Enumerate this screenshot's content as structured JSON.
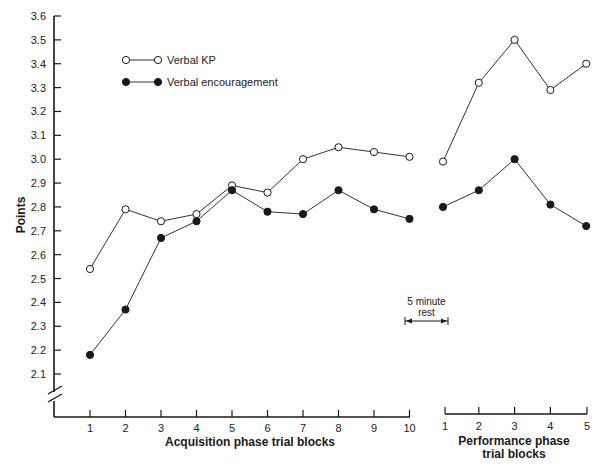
{
  "chart_data": {
    "type": "line",
    "title": "",
    "ylabel": "Points",
    "ylim": [
      2.0,
      3.6
    ],
    "y_ticks": [
      "3.6",
      "3.5",
      "3.4",
      "3.3",
      "3.2",
      "3.1",
      "3.0",
      "2.9",
      "2.8",
      "2.7",
      "2.6",
      "2.5",
      "2.4",
      "2.3",
      "2.2",
      "2.1"
    ],
    "y_axis_break": true,
    "grid": false,
    "legend_position": "upper-left",
    "panels": [
      {
        "name": "acquisition",
        "xlabel": "Acquisition phase trial blocks",
        "categories": [
          "1",
          "2",
          "3",
          "4",
          "5",
          "6",
          "7",
          "8",
          "9",
          "10"
        ],
        "series": [
          {
            "name": "Verbal KP",
            "marker": "open-circle",
            "values": [
              2.54,
              2.79,
              2.74,
              2.77,
              2.89,
              2.86,
              3.0,
              3.05,
              3.03,
              3.01
            ]
          },
          {
            "name": "Verbal encouragement",
            "marker": "filled-circle",
            "values": [
              2.18,
              2.37,
              2.67,
              2.74,
              2.87,
              2.78,
              2.77,
              2.87,
              2.79,
              2.75
            ]
          }
        ]
      },
      {
        "name": "performance",
        "xlabel": "Performance phase trial blocks",
        "xlabel_lines": [
          "Performance phase",
          "trial blocks"
        ],
        "categories": [
          "1",
          "2",
          "3",
          "4",
          "5"
        ],
        "series": [
          {
            "name": "Verbal KP",
            "marker": "open-circle",
            "values": [
              2.99,
              3.32,
              3.5,
              3.29,
              3.4
            ]
          },
          {
            "name": "Verbal encouragement",
            "marker": "filled-circle",
            "values": [
              2.8,
              2.87,
              3.0,
              2.81,
              2.72
            ]
          }
        ]
      }
    ],
    "annotations": [
      {
        "text": "5 minute rest",
        "lines": [
          "5 minute",
          "rest"
        ],
        "type": "double-arrow",
        "between": [
          "acquisition block 10",
          "performance block 1"
        ]
      }
    ]
  },
  "legend": {
    "items": [
      {
        "label": "Verbal KP",
        "marker": "open-circle"
      },
      {
        "label": "Verbal encouragement",
        "marker": "filled-circle"
      }
    ]
  },
  "colors": {
    "ink": "#1a1a1a",
    "line": "#333333",
    "background": "#ffffff"
  }
}
